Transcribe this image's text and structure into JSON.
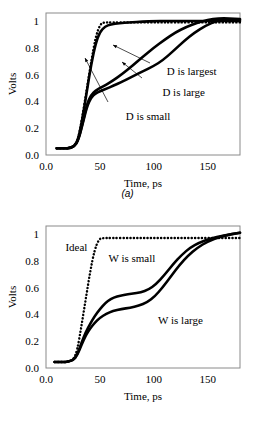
{
  "figure": {
    "panels": [
      {
        "sublabel": "(a)",
        "xlabel": "Time, ps",
        "ylabel": "Volts",
        "xticks": [
          "0.0",
          "50",
          "100",
          "150"
        ],
        "xtickvals": [
          0,
          50,
          100,
          150
        ],
        "yticks": [
          "0.0",
          "0.2",
          "0.4",
          "0.6",
          "0.8",
          "1"
        ],
        "ytickvals": [
          0,
          0.2,
          0.4,
          0.6,
          0.8,
          1.0
        ],
        "annotations": [
          {
            "text": "D is largest",
            "x": 112,
            "y": 0.6
          },
          {
            "text": "D is large",
            "x": 108,
            "y": 0.44
          },
          {
            "text": "D is small",
            "x": 74,
            "y": 0.265
          }
        ]
      },
      {
        "sublabel": "(b)",
        "xlabel": "Time, ps",
        "ylabel": "Volts",
        "xticks": [
          "0.0",
          "50",
          "100",
          "150"
        ],
        "xtickvals": [
          0,
          50,
          100,
          150
        ],
        "yticks": [
          "0.0",
          "0.2",
          "0.4",
          "0.6",
          "0.8",
          "1"
        ],
        "ytickvals": [
          0,
          0.2,
          0.4,
          0.6,
          0.8,
          1.0
        ],
        "annotations": [
          {
            "text": "Ideal",
            "x": 18,
            "y": 0.875
          },
          {
            "text": "W is small",
            "x": 58,
            "y": 0.795
          },
          {
            "text": "W is large",
            "x": 104,
            "y": 0.325
          }
        ]
      }
    ]
  },
  "chart_data": [
    {
      "type": "line",
      "title": "",
      "xlabel": "Time, ps",
      "ylabel": "Volts",
      "xlim": [
        0,
        180
      ],
      "ylim": [
        0.0,
        1.06
      ],
      "grid": false,
      "legend_position": "inline-annotations",
      "series": [
        {
          "name": "Ideal",
          "style": "dotted",
          "x": [
            10,
            20,
            26,
            30,
            34,
            38,
            42,
            46,
            50,
            53,
            60,
            80,
            100,
            120,
            150,
            180
          ],
          "y": [
            0.05,
            0.05,
            0.06,
            0.12,
            0.3,
            0.5,
            0.7,
            0.88,
            0.97,
            0.99,
            0.99,
            0.99,
            0.99,
            0.99,
            0.99,
            0.99
          ]
        },
        {
          "name": "D is small",
          "style": "solid",
          "x": [
            10,
            20,
            26,
            30,
            34,
            38,
            42,
            46,
            50,
            55,
            60,
            68,
            78,
            90,
            100,
            112,
            125,
            140,
            155,
            168,
            180
          ],
          "y": [
            0.05,
            0.05,
            0.06,
            0.12,
            0.28,
            0.48,
            0.68,
            0.83,
            0.92,
            0.96,
            0.975,
            0.985,
            0.99,
            0.995,
            1.0,
            1.0,
            1.0,
            1.0,
            1.0,
            1.0,
            1.0
          ]
        },
        {
          "name": "D is large",
          "style": "solid",
          "x": [
            10,
            20,
            26,
            30,
            34,
            38,
            42,
            46,
            50,
            56,
            62,
            70,
            80,
            90,
            100,
            110,
            120,
            130,
            140,
            150,
            160,
            170,
            180
          ],
          "y": [
            0.05,
            0.05,
            0.06,
            0.11,
            0.24,
            0.38,
            0.45,
            0.48,
            0.5,
            0.525,
            0.555,
            0.6,
            0.665,
            0.735,
            0.8,
            0.86,
            0.915,
            0.955,
            0.985,
            1.01,
            1.02,
            1.02,
            1.015
          ]
        },
        {
          "name": "D is largest",
          "style": "solid",
          "x": [
            10,
            20,
            26,
            30,
            34,
            38,
            42,
            46,
            50,
            56,
            62,
            70,
            80,
            90,
            100,
            108,
            118,
            128,
            138,
            148,
            158,
            168,
            180
          ],
          "y": [
            0.05,
            0.05,
            0.06,
            0.11,
            0.23,
            0.36,
            0.43,
            0.46,
            0.475,
            0.495,
            0.515,
            0.545,
            0.585,
            0.625,
            0.665,
            0.705,
            0.775,
            0.85,
            0.915,
            0.965,
            1.0,
            1.015,
            1.01
          ]
        }
      ]
    },
    {
      "type": "line",
      "title": "",
      "xlabel": "Time, ps",
      "ylabel": "Volts",
      "xlim": [
        0,
        180
      ],
      "ylim": [
        0.0,
        1.06
      ],
      "grid": false,
      "legend_position": "inline-annotations",
      "series": [
        {
          "name": "Ideal",
          "style": "dotted",
          "x": [
            8,
            18,
            25,
            29,
            33,
            37,
            41,
            45,
            49,
            52,
            60,
            80,
            100,
            120,
            140,
            160,
            180
          ],
          "y": [
            0.045,
            0.045,
            0.055,
            0.13,
            0.32,
            0.52,
            0.72,
            0.88,
            0.96,
            0.97,
            0.97,
            0.97,
            0.97,
            0.97,
            0.97,
            0.97,
            0.97
          ]
        },
        {
          "name": "W is small",
          "style": "solid",
          "x": [
            8,
            18,
            25,
            29,
            33,
            37,
            41,
            45,
            50,
            55,
            60,
            66,
            72,
            80,
            88,
            95,
            102,
            110,
            118,
            126,
            134,
            142,
            152,
            165,
            180
          ],
          "y": [
            0.045,
            0.045,
            0.055,
            0.1,
            0.19,
            0.27,
            0.33,
            0.385,
            0.44,
            0.485,
            0.515,
            0.535,
            0.545,
            0.555,
            0.565,
            0.585,
            0.625,
            0.695,
            0.775,
            0.845,
            0.9,
            0.935,
            0.965,
            0.99,
            1.01
          ]
        },
        {
          "name": "W is large",
          "style": "solid",
          "x": [
            8,
            18,
            25,
            29,
            33,
            37,
            41,
            45,
            50,
            56,
            62,
            70,
            78,
            86,
            94,
            101,
            108,
            116,
            124,
            132,
            140,
            150,
            163,
            180
          ],
          "y": [
            0.045,
            0.045,
            0.055,
            0.095,
            0.175,
            0.245,
            0.295,
            0.335,
            0.375,
            0.405,
            0.425,
            0.44,
            0.45,
            0.465,
            0.49,
            0.535,
            0.6,
            0.685,
            0.77,
            0.84,
            0.895,
            0.945,
            0.985,
            1.01
          ]
        }
      ]
    }
  ]
}
